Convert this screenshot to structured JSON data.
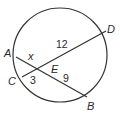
{
  "diagram": {
    "type": "intersecting-chords-in-circle",
    "circle": {
      "cx": 60,
      "cy": 55,
      "r": 47
    },
    "points": {
      "A": {
        "label": "A",
        "x": 16,
        "y": 57
      },
      "B": {
        "label": "B",
        "x": 87,
        "y": 97
      },
      "C": {
        "label": "C",
        "x": 22,
        "y": 77
      },
      "D": {
        "label": "D",
        "x": 106,
        "y": 31
      },
      "E": {
        "label": "E",
        "x": 39,
        "y": 68
      }
    },
    "chords": [
      {
        "name": "AB",
        "from": "A",
        "to": "B"
      },
      {
        "name": "CD",
        "from": "C",
        "to": "D"
      }
    ],
    "segment_labels": {
      "AE": "x",
      "ED": "12",
      "CE": "3",
      "EB": "9"
    },
    "point_labels": {
      "A": "A",
      "B": "B",
      "C": "C",
      "D": "D",
      "E": "E"
    },
    "stroke_color": "#333333"
  }
}
